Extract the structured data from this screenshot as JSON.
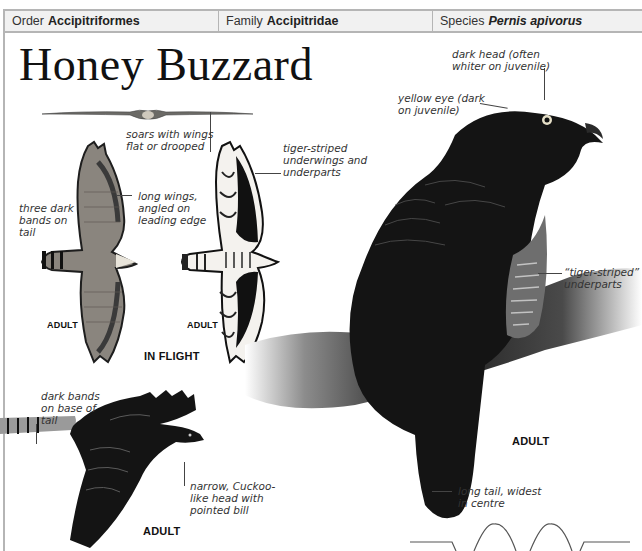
{
  "header": {
    "order": {
      "label": "Order",
      "value": "Accipitriformes"
    },
    "family": {
      "label": "Family",
      "value": "Accipitridae"
    },
    "species": {
      "label": "Species",
      "value": "Pernis apivorus"
    }
  },
  "title": "Honey Buzzard",
  "annotations": {
    "soar": [
      "soars with wings",
      "flat or drooped"
    ],
    "tail_bands": [
      "three dark",
      "bands on",
      "tail"
    ],
    "long_wings": [
      "long wings,",
      "angled on",
      "leading edge"
    ],
    "tiger_underwings": [
      "tiger-striped",
      "underwings and",
      "underparts"
    ],
    "dark_head": [
      "dark head (often",
      "whiter on juvenile)"
    ],
    "yellow_eye": [
      "yellow eye (dark",
      "on juvenile)"
    ],
    "tiger_underparts": [
      "“tiger-striped”",
      "underparts"
    ],
    "dark_bands_base": [
      "dark bands",
      "on base of",
      "tail"
    ],
    "narrow_head": [
      "narrow, Cuckoo-",
      "like head with",
      "pointed bill"
    ],
    "long_tail": [
      "long tail, widest",
      "in centre"
    ]
  },
  "labels": {
    "adult_flight_upper": "ADULT",
    "adult_flight_under": "ADULT",
    "in_flight": "IN FLIGHT",
    "adult_flying_photo": "ADULT",
    "adult_perched": "ADULT"
  },
  "illustrations": {
    "soaring_silhouette": "soaring-bird",
    "flight_upperside": "honey-buzzard-upperside",
    "flight_underside": "honey-buzzard-underside",
    "flying_photo": "honey-buzzard-flying",
    "perched_photo": "honey-buzzard-perched",
    "flight_pattern": "undulating-flight-path"
  }
}
